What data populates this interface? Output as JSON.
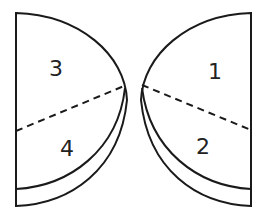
{
  "diagram": {
    "left_piece": {
      "regions": [
        {
          "id": "3",
          "label": "3"
        },
        {
          "id": "4",
          "label": "4"
        }
      ]
    },
    "right_piece": {
      "regions": [
        {
          "id": "1",
          "label": "1"
        },
        {
          "id": "2",
          "label": "2"
        }
      ]
    },
    "colors": {
      "stroke": "#1a1a1a",
      "fill": "#ffffff",
      "text": "#222222"
    }
  }
}
